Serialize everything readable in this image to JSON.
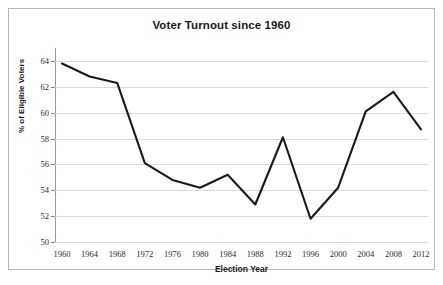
{
  "chart_data": {
    "type": "line",
    "title": "Voter Turnout since 1960",
    "xlabel": "Election Year",
    "ylabel": "% of Eligible Voters",
    "categories": [
      1960,
      1964,
      1968,
      1972,
      1976,
      1980,
      1984,
      1988,
      1992,
      1996,
      2000,
      2004,
      2008,
      2012
    ],
    "xtick_labels": [
      "1960",
      "1964",
      "1968",
      "1972",
      "1976",
      "1980",
      "1984",
      "1988",
      "1992",
      "1996",
      "2000",
      "2004",
      "2008",
      "2012"
    ],
    "values": [
      63.8,
      62.8,
      62.3,
      56.1,
      54.8,
      54.2,
      55.2,
      52.9,
      58.1,
      51.8,
      54.2,
      60.1,
      61.6,
      58.7
    ],
    "series": [
      {
        "name": "Voter Turnout",
        "values": [
          63.8,
          62.8,
          62.3,
          56.1,
          54.8,
          54.2,
          55.2,
          52.9,
          58.1,
          51.8,
          54.2,
          60.1,
          61.6,
          58.7
        ]
      }
    ],
    "ylim": [
      50,
      65
    ],
    "ytick_values": [
      50,
      52,
      54,
      56,
      58,
      60,
      62,
      64
    ],
    "ytick_labels": [
      "50",
      "52",
      "54",
      "56",
      "58",
      "60",
      "62",
      "64"
    ],
    "grid": "horizontal",
    "legend": "none",
    "line_color": "#1a1a1a",
    "grid_color": "#d9d9d9",
    "border_color": "#b6b6b6",
    "background": "#ffffff"
  }
}
